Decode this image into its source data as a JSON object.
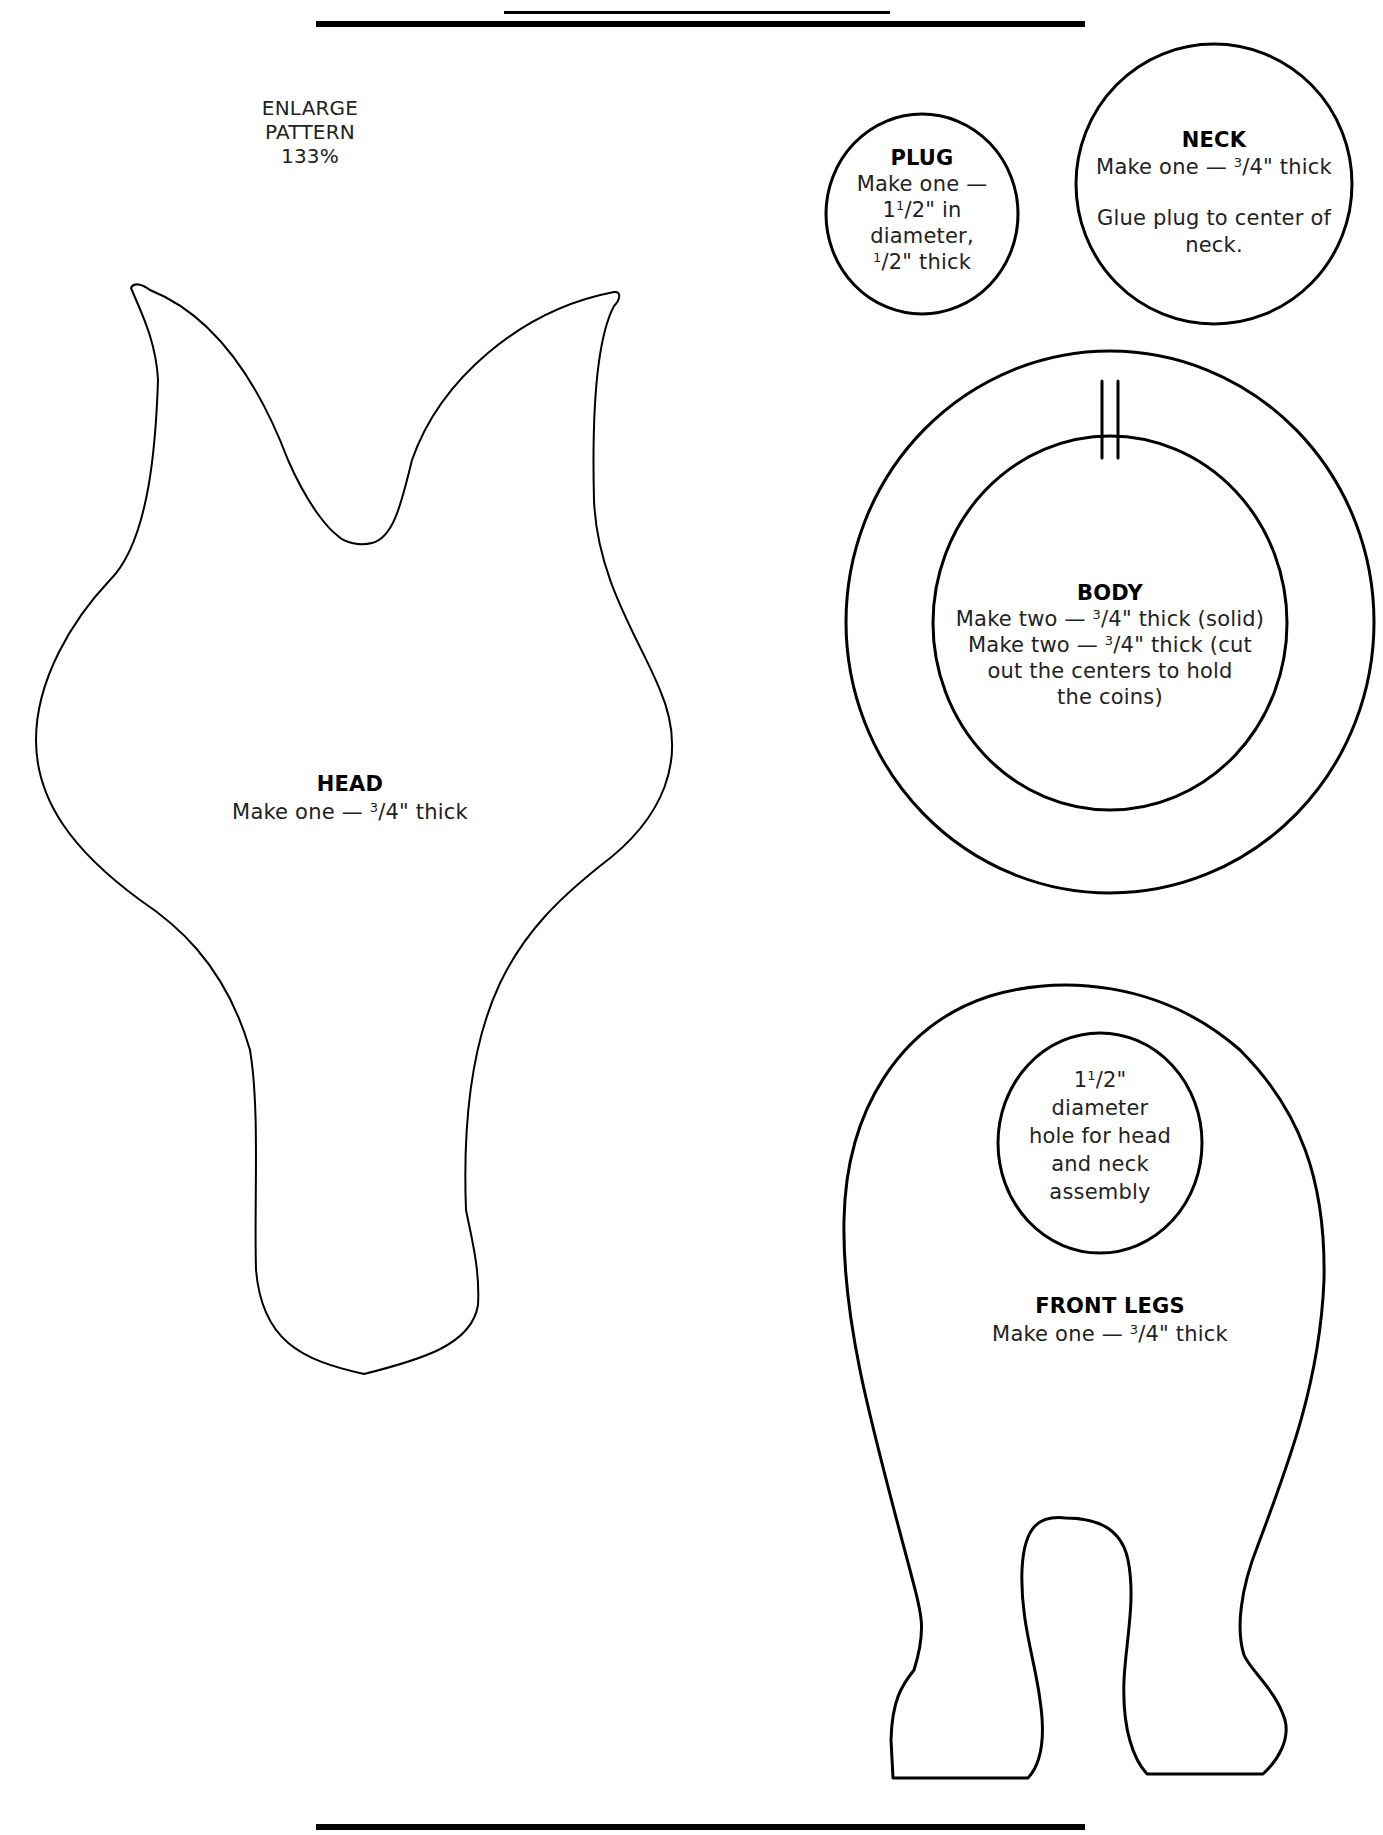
{
  "page": {
    "rules": {
      "top_short": {
        "x1": 504,
        "x2": 890,
        "y": 12
      },
      "top_long": {
        "x1": 316,
        "x2": 1085,
        "y": 24
      },
      "bottom_long": {
        "x1": 316,
        "x2": 1085,
        "y": 1828
      }
    },
    "note": {
      "lines": [
        "ENLARGE",
        "PATTERN",
        "133%"
      ]
    }
  },
  "pieces": {
    "plug": {
      "title": "PLUG",
      "lines": [
        "Make one —",
        "1 1/2\" in",
        "diameter,",
        "1/2\" thick"
      ],
      "line_parts": [
        {
          "pre": "Make one —",
          "sup": "",
          "post": ""
        },
        {
          "pre": "1",
          "sup": "1",
          "post": "/2\" in"
        },
        {
          "pre": "diameter,",
          "sup": "",
          "post": ""
        },
        {
          "pre": "",
          "sup": "1",
          "post": "/2\" thick"
        }
      ]
    },
    "neck": {
      "title": "NECK",
      "line_parts": [
        {
          "pre": "Make one — ",
          "sup": "3",
          "post": "/4\" thick"
        }
      ],
      "instruction_lines": [
        "Glue plug to center of",
        "neck."
      ]
    },
    "body": {
      "title": "BODY",
      "line_parts": [
        {
          "pre": "Make two — ",
          "sup": "3",
          "post": "/4\" thick (solid)"
        },
        {
          "pre": "Make two — ",
          "sup": "3",
          "post": "/4\" thick (cut"
        },
        {
          "pre": "out the centers to hold",
          "sup": "",
          "post": ""
        },
        {
          "pre": "the coins)",
          "sup": "",
          "post": ""
        }
      ]
    },
    "head": {
      "title": "HEAD",
      "line_parts": [
        {
          "pre": "Make one — ",
          "sup": "3",
          "post": "/4\" thick"
        }
      ]
    },
    "front_legs": {
      "title": "FRONT LEGS",
      "line_parts": [
        {
          "pre": "Make one — ",
          "sup": "3",
          "post": "/4\" thick"
        }
      ],
      "hole": {
        "line_parts": [
          {
            "pre": "1",
            "sup": "1",
            "post": "/2\""
          },
          {
            "pre": "diameter",
            "sup": "",
            "post": ""
          },
          {
            "pre": "hole for head",
            "sup": "",
            "post": ""
          },
          {
            "pre": "and neck",
            "sup": "",
            "post": ""
          },
          {
            "pre": "assembly",
            "sup": "",
            "post": ""
          }
        ]
      }
    }
  },
  "colors": {
    "stroke": "#000000",
    "text": "#222222",
    "background": "#ffffff"
  }
}
